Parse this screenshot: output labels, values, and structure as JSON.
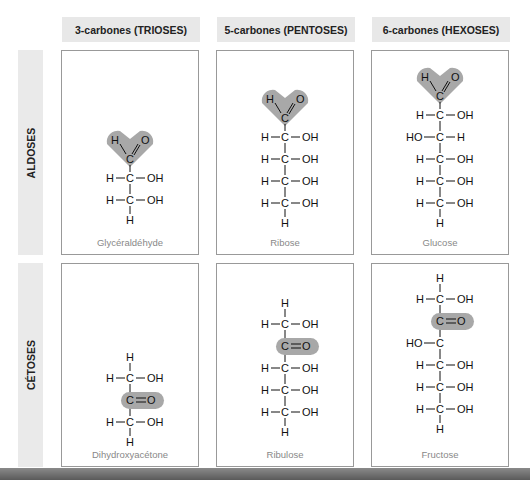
{
  "columns": [
    {
      "label": "3-carbones (TRIOSES)"
    },
    {
      "label": "5-carbones (PENTOSES)"
    },
    {
      "label": "6-carbones (HEXOSES)"
    }
  ],
  "rows": [
    {
      "label": "ALDOSES"
    },
    {
      "label": "CÉTOSES"
    }
  ],
  "molecules": {
    "glyceraldehyde": {
      "name": "Glycéraldéhyde",
      "row": "ALDOSES",
      "carbons": 3,
      "functional_group": "C=O aldehyde (H-C=O)",
      "chain": [
        "H-C-OH",
        "H-C-OH",
        "H"
      ]
    },
    "ribose": {
      "name": "Ribose",
      "row": "ALDOSES",
      "carbons": 5,
      "functional_group": "C=O aldehyde (H-C=O)",
      "chain": [
        "H-C-OH",
        "H-C-OH",
        "H-C-OH",
        "H-C-OH",
        "H"
      ]
    },
    "glucose": {
      "name": "Glucose",
      "row": "ALDOSES",
      "carbons": 6,
      "functional_group": "C=O aldehyde (H-C=O)",
      "chain": [
        "H-C-OH",
        "HO-C-H",
        "H-C-OH",
        "H-C-OH",
        "H-C-OH",
        "H"
      ]
    },
    "dihydroxyacetone": {
      "name": "Dihydroxyacétone",
      "row": "CÉTOSES",
      "carbons": 3,
      "functional_group": "C=O ketone",
      "chain": [
        "H",
        "H-C-OH",
        "C=O",
        "H-C-OH",
        "H"
      ]
    },
    "ribulose": {
      "name": "Ribulose",
      "row": "CÉTOSES",
      "carbons": 5,
      "functional_group": "C=O ketone",
      "chain": [
        "H",
        "H-C-OH",
        "C=O",
        "H-C-OH",
        "H-C-OH",
        "H-C-OH",
        "H"
      ]
    },
    "fructose": {
      "name": "Fructose",
      "row": "CÉTOSES",
      "carbons": 6,
      "functional_group": "C=O ketone",
      "chain": [
        "H",
        "H-C-OH",
        "C=O",
        "HO-C-H",
        "H-C-OH",
        "H-C-OH",
        "H-C-OH",
        "H"
      ]
    }
  },
  "atoms": {
    "H": "H",
    "C": "C",
    "O": "O",
    "OH": "OH",
    "HO": "HO"
  },
  "colors": {
    "highlight": "#a8a8a8",
    "header_bg": "#e8e8e8",
    "border": "#999999",
    "caption": "#888888"
  }
}
